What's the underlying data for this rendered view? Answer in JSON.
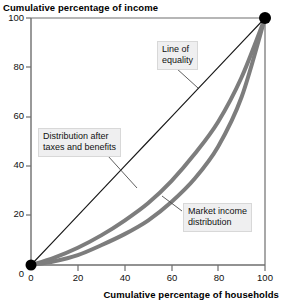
{
  "chart_data": {
    "type": "line",
    "title": "",
    "ylabel": "Cumulative percentage of income",
    "xlabel": "Cumulative percentage of households",
    "xlim": [
      0,
      100
    ],
    "ylim": [
      0,
      100
    ],
    "xticks": [
      0,
      20,
      40,
      60,
      80,
      100
    ],
    "yticks": [
      0,
      20,
      40,
      60,
      80,
      100
    ],
    "grid": false,
    "legend_position": "none",
    "annotations": [
      {
        "name": "line-of-equality",
        "text": "Line of equality",
        "lines": [
          "Line of",
          "equality"
        ],
        "points_to": [
          63,
          63
        ]
      },
      {
        "name": "after-taxes-benefits",
        "text": "Distribution after taxes and benefits",
        "lines": [
          "Distribution after",
          "taxes and benefits"
        ],
        "points_to": [
          46,
          22
        ]
      },
      {
        "name": "market-income",
        "text": "Market income distribution",
        "lines": [
          "Market income",
          "distribution"
        ],
        "points_to": [
          64,
          27
        ]
      }
    ],
    "x": [
      0,
      10,
      20,
      30,
      40,
      50,
      60,
      70,
      80,
      90,
      100
    ],
    "series": [
      {
        "name": "Line of equality",
        "color": "#1a1a1a",
        "style": "straight",
        "width": 1.2,
        "values": [
          0,
          10,
          20,
          30,
          40,
          50,
          60,
          70,
          80,
          90,
          100
        ]
      },
      {
        "name": "Distribution after taxes and benefits",
        "color": "#7d7d7d",
        "style": "curve",
        "width": 4,
        "values": [
          0,
          3,
          7,
          12,
          18,
          25,
          34,
          45,
          58,
          76,
          100
        ]
      },
      {
        "name": "Market income distribution",
        "color": "#7d7d7d",
        "style": "curve",
        "width": 4,
        "values": [
          0,
          1.5,
          4,
          8,
          12.5,
          18,
          25.5,
          35,
          48,
          68,
          100
        ]
      }
    ],
    "markers": [
      {
        "name": "origin-point",
        "x": 0,
        "y": 0,
        "color": "#000000"
      },
      {
        "name": "endpoint",
        "x": 100,
        "y": 100,
        "color": "#000000"
      }
    ],
    "axis_tick_labels": {
      "y": [
        "100",
        "80",
        "60",
        "40",
        "20",
        "0"
      ],
      "x": [
        "0",
        "20",
        "40",
        "60",
        "80",
        "100"
      ]
    }
  }
}
